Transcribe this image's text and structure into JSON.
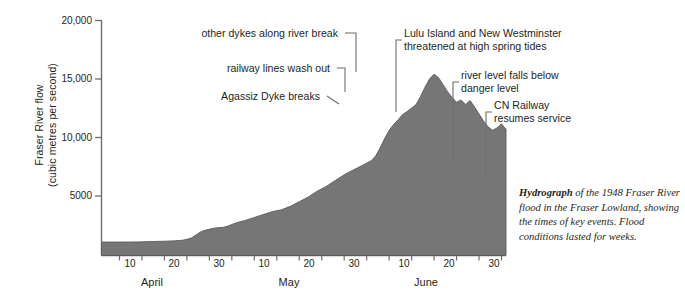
{
  "figure": {
    "caption_lead": "Hydrograph",
    "caption_rest": " of the 1948 Fraser River flood in the Fraser Lowland, showing the times of key events. Flood conditions lasted for weeks."
  },
  "chart_data": {
    "type": "area",
    "title": "Hydrograph of the 1948 Fraser River flood",
    "xlabel": "",
    "ylabel": "Fraser River flow\n(cubic metres per second)",
    "ylim": [
      0,
      20000
    ],
    "yticks": [
      5000,
      10000,
      15000,
      20000
    ],
    "ytick_labels": [
      "5000",
      "10,000",
      "15,000",
      "20,000"
    ],
    "grid": false,
    "legend": "none",
    "fill_color": "#767676",
    "line_color": "#5a5a5a",
    "x_axis": {
      "unit": "day of year 1948",
      "range": [
        "April 1",
        "June 30"
      ],
      "minor_tick_every_days": 5,
      "months": [
        {
          "label": "April",
          "start_day": 1,
          "days": 30
        },
        {
          "label": "May",
          "start_day": 31,
          "days": 31
        },
        {
          "label": "June",
          "start_day": 62,
          "days": 30
        }
      ],
      "tick_labels": [
        {
          "label": "10",
          "month": "April",
          "day": 10
        },
        {
          "label": "20",
          "month": "April",
          "day": 20
        },
        {
          "label": "30",
          "month": "April",
          "day": 30
        },
        {
          "label": "10",
          "month": "May",
          "day": 10
        },
        {
          "label": "20",
          "month": "May",
          "day": 20
        },
        {
          "label": "30",
          "month": "May",
          "day": 30
        },
        {
          "label": "10",
          "month": "June",
          "day": 10
        },
        {
          "label": "20",
          "month": "June",
          "day": 20
        },
        {
          "label": "30",
          "month": "June",
          "day": 30
        }
      ]
    },
    "x": [
      1,
      3,
      5,
      7,
      9,
      11,
      13,
      15,
      17,
      19,
      20,
      21,
      22,
      23,
      24,
      25,
      26,
      27,
      28,
      29,
      30,
      31,
      33,
      35,
      37,
      39,
      41,
      43,
      45,
      47,
      49,
      51,
      53,
      55,
      57,
      59,
      61,
      62,
      63,
      64,
      65,
      66,
      67,
      68,
      69,
      70,
      71,
      72,
      73,
      74,
      75,
      76,
      77,
      78,
      79,
      80,
      81,
      82,
      83,
      84,
      85,
      86,
      87,
      88,
      89,
      90,
      91
    ],
    "y": [
      1150,
      1150,
      1150,
      1150,
      1160,
      1180,
      1200,
      1220,
      1250,
      1300,
      1380,
      1500,
      1750,
      2000,
      2150,
      2250,
      2330,
      2380,
      2400,
      2500,
      2650,
      2800,
      3000,
      3250,
      3500,
      3750,
      3900,
      4200,
      4600,
      5000,
      5500,
      5900,
      6400,
      6900,
      7300,
      7700,
      8100,
      8500,
      9200,
      10000,
      10700,
      11200,
      11600,
      12050,
      12300,
      12600,
      12900,
      13600,
      14400,
      15100,
      15500,
      15200,
      14600,
      14000,
      13500,
      13100,
      13300,
      12900,
      13250,
      12700,
      12100,
      11500,
      11000,
      10700,
      10900,
      11250,
      10800
    ],
    "series_note": "Fraser River daily discharge, April 1 – June 30, 1948",
    "peak": {
      "value": 15500,
      "date": "May 31",
      "label": "flood peak"
    },
    "baseline_flow": 1150,
    "annotations": [
      {
        "id": "agassiz-dyke-breaks",
        "text": "Agassiz Dyke breaks",
        "day": 70,
        "flow": 12600
      },
      {
        "id": "railway-lines-wash-out",
        "text": "railway lines wash out",
        "day": 72,
        "flow": 13600
      },
      {
        "id": "other-dykes-break",
        "text": "other dykes along river break",
        "day": 74,
        "flow": 14400
      },
      {
        "id": "lulu-island-threatened",
        "text": "Lulu Island and New Westminster\nthreatened at high spring tides",
        "day": 79,
        "flow": 13500
      },
      {
        "id": "river-level-falls",
        "text": "river level falls below\ndanger level",
        "day": 86,
        "flow": 11500
      },
      {
        "id": "cn-railway-resumes",
        "text": "CN Railway\nresumes service",
        "day": 90,
        "flow": 11250
      }
    ]
  },
  "axis": {
    "y_label": "Fraser River flow\n(cubic metres per second)",
    "y_ticks": [
      "20,000",
      "15,000",
      "10,000",
      "5000"
    ],
    "x_ticks": [
      "10",
      "20",
      "30",
      "10",
      "20",
      "30",
      "10",
      "20",
      "30"
    ],
    "x_months": [
      "April",
      "May",
      "June"
    ]
  },
  "annotations": {
    "agassiz": "Agassiz Dyke breaks",
    "railway_wash_out": "railway lines wash out",
    "other_dykes": "other dykes along river break",
    "lulu_island": "Lulu Island and New Westminster\nthreatened at high spring tides",
    "river_falls": "river level falls below\ndanger level",
    "cn_railway": "CN Railway\nresumes service"
  }
}
